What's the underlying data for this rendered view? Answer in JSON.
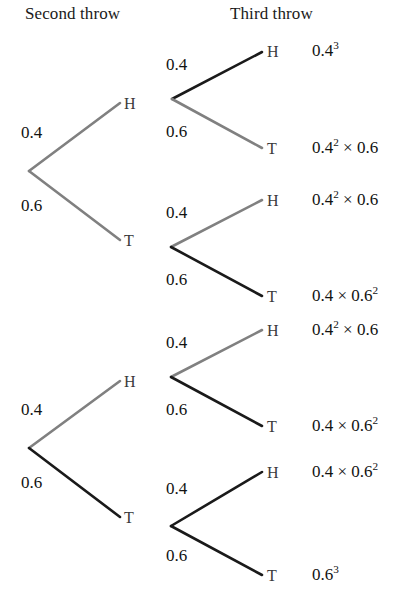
{
  "headers": [
    {
      "label": "Second throw",
      "x": 25,
      "y": 4
    },
    {
      "label": "Third throw",
      "x": 230,
      "y": 4
    }
  ],
  "colors": {
    "gray_branch": "#808080",
    "black_branch": "#1a1a1a",
    "node_letter": "#3a3a3a",
    "text": "#121212",
    "background": "#ffffff"
  },
  "branches": [
    {
      "name": "root-to-H",
      "x1": 29,
      "y1": 171,
      "x2": 120,
      "y2": 103,
      "color": "#808080",
      "width": 2.6
    },
    {
      "name": "root-to-T",
      "x1": 29,
      "y1": 171,
      "x2": 120,
      "y2": 240,
      "color": "#808080",
      "width": 2.6
    },
    {
      "name": "root2-to-H",
      "x1": 29,
      "y1": 448,
      "x2": 120,
      "y2": 381,
      "color": "#808080",
      "width": 2.6
    },
    {
      "name": "root2-to-T",
      "x1": 29,
      "y1": 448,
      "x2": 120,
      "y2": 517,
      "color": "#1a1a1a",
      "width": 2.6
    },
    {
      "name": "n1-to-H",
      "x1": 172,
      "y1": 99,
      "x2": 262,
      "y2": 52,
      "color": "#1a1a1a",
      "width": 2.6
    },
    {
      "name": "n1-to-T",
      "x1": 172,
      "y1": 99,
      "x2": 262,
      "y2": 148,
      "color": "#808080",
      "width": 2.6
    },
    {
      "name": "n2-to-H",
      "x1": 171,
      "y1": 247,
      "x2": 262,
      "y2": 200,
      "color": "#808080",
      "width": 2.6
    },
    {
      "name": "n2-to-T",
      "x1": 171,
      "y1": 247,
      "x2": 262,
      "y2": 296,
      "color": "#1a1a1a",
      "width": 2.6
    },
    {
      "name": "n3-to-H",
      "x1": 171,
      "y1": 377,
      "x2": 262,
      "y2": 330,
      "color": "#808080",
      "width": 2.6
    },
    {
      "name": "n3-to-T",
      "x1": 171,
      "y1": 377,
      "x2": 262,
      "y2": 426,
      "color": "#1a1a1a",
      "width": 2.6
    },
    {
      "name": "n4-to-H",
      "x1": 171,
      "y1": 526,
      "x2": 262,
      "y2": 472,
      "color": "#1a1a1a",
      "width": 2.6
    },
    {
      "name": "n4-to-T",
      "x1": 171,
      "y1": 526,
      "x2": 262,
      "y2": 575,
      "color": "#1a1a1a",
      "width": 2.6
    }
  ],
  "probabilities": [
    {
      "name": "prob-second-H-top",
      "value": "0.4",
      "x": 21,
      "y": 123
    },
    {
      "name": "prob-second-T-top",
      "value": "0.6",
      "x": 21,
      "y": 196
    },
    {
      "name": "prob-second-H-bottom",
      "value": "0.4",
      "x": 21,
      "y": 400
    },
    {
      "name": "prob-second-T-bottom",
      "value": "0.6",
      "x": 21,
      "y": 473
    },
    {
      "name": "prob-third-1-H",
      "value": "0.4",
      "x": 166,
      "y": 55
    },
    {
      "name": "prob-third-1-T",
      "value": "0.6",
      "x": 166,
      "y": 122
    },
    {
      "name": "prob-third-2-H",
      "value": "0.4",
      "x": 166,
      "y": 203
    },
    {
      "name": "prob-third-2-T",
      "value": "0.6",
      "x": 166,
      "y": 270
    },
    {
      "name": "prob-third-3-H",
      "value": "0.4",
      "x": 166,
      "y": 333
    },
    {
      "name": "prob-third-3-T",
      "value": "0.6",
      "x": 166,
      "y": 400
    },
    {
      "name": "prob-third-4-H",
      "value": "0.4",
      "x": 166,
      "y": 479
    },
    {
      "name": "prob-third-4-T",
      "value": "0.6",
      "x": 166,
      "y": 546
    }
  ],
  "nodes": [
    {
      "name": "node-second-H-top",
      "label": "H",
      "x": 124,
      "y": 95
    },
    {
      "name": "node-second-T-top",
      "label": "T",
      "x": 124,
      "y": 232
    },
    {
      "name": "node-second-H-bottom",
      "label": "H",
      "x": 124,
      "y": 373
    },
    {
      "name": "node-second-T-bottom",
      "label": "T",
      "x": 124,
      "y": 509
    },
    {
      "name": "node-third-1-H",
      "label": "H",
      "x": 267,
      "y": 43
    },
    {
      "name": "node-third-1-T",
      "label": "T",
      "x": 267,
      "y": 140
    },
    {
      "name": "node-third-2-H",
      "label": "H",
      "x": 267,
      "y": 192
    },
    {
      "name": "node-third-2-T",
      "label": "T",
      "x": 267,
      "y": 288
    },
    {
      "name": "node-third-3-H",
      "label": "H",
      "x": 267,
      "y": 322
    },
    {
      "name": "node-third-3-T",
      "label": "T",
      "x": 267,
      "y": 418
    },
    {
      "name": "node-third-4-H",
      "label": "H",
      "x": 267,
      "y": 464
    },
    {
      "name": "node-third-4-T",
      "label": "T",
      "x": 267,
      "y": 567
    }
  ],
  "outcomes": [
    {
      "name": "outcome-HHH",
      "base1": "0.4",
      "exp1": "3",
      "op": "",
      "base2": "",
      "exp2": "",
      "x": 312,
      "y": 41
    },
    {
      "name": "outcome-HHT",
      "base1": "0.4",
      "exp1": "2",
      "op": " × ",
      "base2": "0.6",
      "exp2": "",
      "x": 312,
      "y": 138
    },
    {
      "name": "outcome-HTH",
      "base1": "0.4",
      "exp1": "2",
      "op": " × ",
      "base2": "0.6",
      "exp2": "",
      "x": 312,
      "y": 190
    },
    {
      "name": "outcome-HTT",
      "base1": "0.4",
      "exp1": "",
      "op": " × ",
      "base2": "0.6",
      "exp2": "2",
      "x": 312,
      "y": 286
    },
    {
      "name": "outcome-THH",
      "base1": "0.4",
      "exp1": "2",
      "op": " × ",
      "base2": "0.6",
      "exp2": "",
      "x": 312,
      "y": 320
    },
    {
      "name": "outcome-THT",
      "base1": "0.4",
      "exp1": "",
      "op": " × ",
      "base2": "0.6",
      "exp2": "2",
      "x": 312,
      "y": 416
    },
    {
      "name": "outcome-TTH",
      "base1": "0.4",
      "exp1": "",
      "op": " × ",
      "base2": "0.6",
      "exp2": "2",
      "x": 312,
      "y": 462
    },
    {
      "name": "outcome-TTT",
      "base1": "0.6",
      "exp1": "3",
      "op": "",
      "base2": "",
      "exp2": "",
      "x": 312,
      "y": 565
    }
  ]
}
